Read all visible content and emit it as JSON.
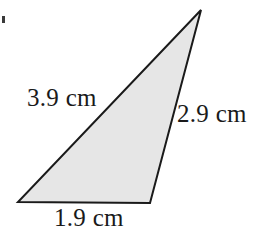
{
  "figure": {
    "name": "scalene-triangle-with-side-lengths",
    "background_color": "#ffffff",
    "shape": {
      "type": "triangle",
      "fill_color": "#e6e6e6",
      "stroke_color": "#1a1a1a",
      "stroke_width": 2,
      "vertices": [
        {
          "name": "apex",
          "x": 201,
          "y": 10
        },
        {
          "name": "bottom-right",
          "x": 150,
          "y": 203
        },
        {
          "name": "bottom-left",
          "x": 18,
          "y": 202
        }
      ]
    },
    "labels": {
      "left_side": "3.9 cm",
      "right_side": "2.9 cm",
      "bottom_side": "1.9 cm"
    },
    "measurements": {
      "unit": "cm",
      "left_side_value": 3.9,
      "right_side_value": 2.9,
      "bottom_side_value": 1.9
    },
    "artifact": {
      "name": "scan-speck",
      "color": "#3a3a3a"
    }
  }
}
